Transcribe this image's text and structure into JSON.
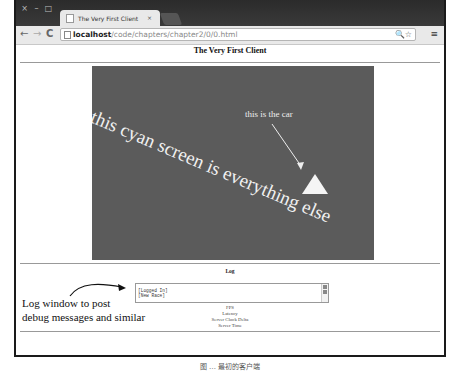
{
  "browser": {
    "tab_title": "The Very First Client",
    "tab_close": "×",
    "window_controls": [
      "×",
      "–",
      "□"
    ],
    "nav": {
      "back": "←",
      "forward": "→",
      "reload": "C"
    },
    "url_host": "localhost",
    "url_path": "/code/chapters/chapter2/0/0.html",
    "addr_icons": "🔍☆",
    "menu_icon": "≡"
  },
  "page": {
    "title": "The Very First Client",
    "canvas": {
      "background_color": "#5b5b5b",
      "main_label": "this cyan screen is everything else",
      "car_label": "this is the car"
    },
    "log": {
      "title": "Log",
      "lines": [
        "[Logged In]",
        "[New Race]"
      ]
    },
    "stats": [
      "FPS",
      "Latency",
      "Server Clock Delta",
      "Server Time"
    ]
  },
  "annotation": {
    "line1": "Log window to post",
    "line2": "debug messages and similar"
  },
  "caption": "图 … 最初的客户端"
}
